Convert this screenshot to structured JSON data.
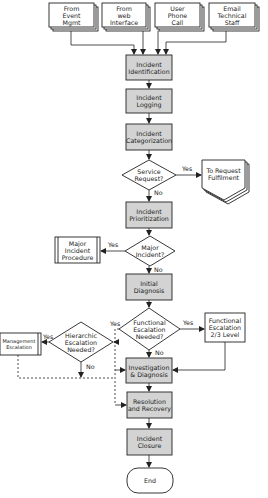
{
  "colors": {
    "process_fill": "#d3d3d3",
    "stroke": "#222222",
    "background": "#ffffff"
  },
  "sources": [
    {
      "id": "event",
      "label": "From\nEvent\nMgmt"
    },
    {
      "id": "web",
      "label": "From\nweb\nInterface"
    },
    {
      "id": "phone",
      "label": "User\nPhone\nCall"
    },
    {
      "id": "email",
      "label": "Email\nTechnical\nStaff"
    }
  ],
  "process": {
    "identification": "Incident\nIdentification",
    "logging": "Incident\nLogging",
    "categorization": "Incident\nCategorization",
    "prioritization": "Incident\nPrioritization",
    "initial_diagnosis": "Initial\nDiagnosis",
    "investigation": "Investigation\n& Diagnosis",
    "resolution": "Resolution\nand Recovery",
    "closure": "Incident\nClosure",
    "end": "End"
  },
  "decisions": {
    "service_request": "Service\nRequest?",
    "major_incident": "Major\nIncident?",
    "functional_escalation": "Functional\nEscalation\nNeeded?",
    "hierarchic_escalation": "Hierarchic\nEscalation\nNeeded?"
  },
  "external": {
    "request_fulfilment": "To Request\nFulfilment",
    "major_incident_procedure": "Major\nIncident\nProcedure",
    "functional_escalation_level": "Functional\nEscalation\n2/3 Level",
    "management_escalation": "Management\nEscalation"
  },
  "edge_labels": {
    "service_yes": "Yes",
    "service_no": "No",
    "major_yes": "Yes",
    "major_no": "No",
    "functional_yes_right": "Yes",
    "functional_yes_left": "Yes",
    "functional_no": "No",
    "hierarchic_yes": "Yes",
    "hierarchic_no": "No"
  }
}
